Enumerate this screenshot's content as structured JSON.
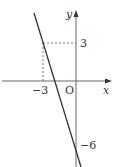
{
  "diagram": {
    "type": "coordinate-graph",
    "axes": {
      "x_label": "x",
      "y_label": "y",
      "origin_label": "O"
    },
    "labels": {
      "y_tick_3": "3",
      "x_tick_neg3": "−3",
      "y_intercept": "−6"
    },
    "line": {
      "passes_through": [
        [
          -3,
          3
        ],
        [
          0,
          -6
        ]
      ],
      "slope": -3,
      "y_intercept": -6,
      "equation": "y = -3x - 6"
    },
    "guides": {
      "dashed_point": [
        -3,
        3
      ]
    },
    "colors": {
      "line": "#333333",
      "axis": "#666666",
      "dashed": "#555555",
      "background": "#ffffff"
    }
  }
}
